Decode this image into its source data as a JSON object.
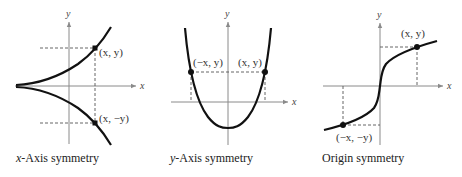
{
  "figures": [
    {
      "caption_var": "x",
      "caption_rest": "-Axis symmetry",
      "axis_x_label": "x",
      "axis_y_label": "y",
      "point_labels": [
        "(x, y)",
        "(x, −y)"
      ]
    },
    {
      "caption_var": "y",
      "caption_rest": "-Axis symmetry",
      "axis_x_label": "x",
      "axis_y_label": "y",
      "point_labels": [
        "(−x, y)",
        "(x, y)"
      ]
    },
    {
      "caption_var": "",
      "caption_rest": "Origin symmetry",
      "axis_x_label": "x",
      "axis_y_label": "y",
      "point_labels": [
        "(x, y)",
        "(−x, −y)"
      ]
    }
  ],
  "colors": {
    "curve": "#111111",
    "axis": "#8a8a8a",
    "text": "#333333"
  }
}
